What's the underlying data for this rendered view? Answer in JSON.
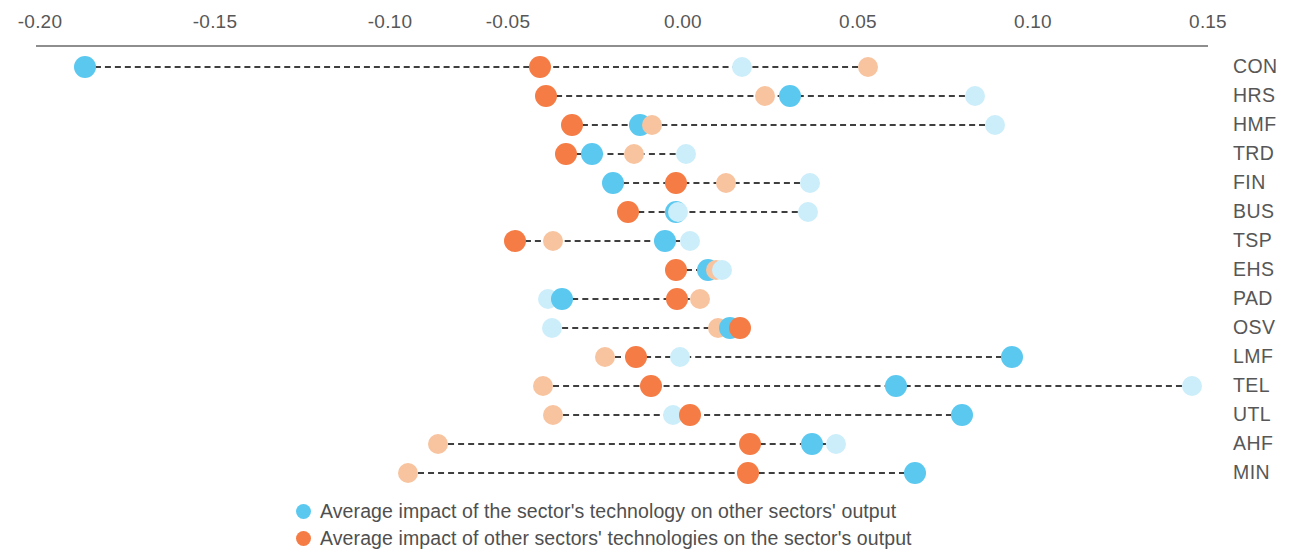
{
  "chart_data": {
    "type": "scatter",
    "title": "",
    "subtitle": "",
    "xlabel": "",
    "ylabel": "",
    "xlim": [
      -0.215,
      0.16
    ],
    "xticks": [
      -0.2,
      -0.15,
      -0.1,
      -0.05,
      0.0,
      0.05,
      0.1,
      0.15
    ],
    "xtick_labels": [
      "-0.20",
      "-0.15",
      "-0.10",
      "-0.05",
      "0.00",
      "0.05",
      "0.10",
      "0.15"
    ],
    "grid": false,
    "legend_position": "bottom-left",
    "categories": [
      "CON",
      "HRS",
      "HMF",
      "TRD",
      "FIN",
      "BUS",
      "TSP",
      "EHS",
      "PAD",
      "OSV",
      "LMF",
      "TEL",
      "UTL",
      "AHF",
      "MIN"
    ],
    "series": [
      {
        "name": "Average impact of the sector's technology on other sectors' output",
        "color": "#5BC8F0",
        "marker": "circle-filled",
        "values": [
          -0.171,
          0.031,
          -0.012,
          -0.026,
          -0.02,
          -0.002,
          -0.005,
          0.007,
          -0.035,
          0.013,
          0.094,
          0.061,
          0.08,
          0.037,
          0.066
        ]
      },
      {
        "name": "Average impact of other sectors' technologies on the sector's output",
        "color": "#F57C45",
        "marker": "circle-filled",
        "values": [
          -0.041,
          -0.039,
          -0.032,
          -0.033,
          -0.002,
          -0.016,
          -0.048,
          -0.002,
          -0.002,
          0.016,
          -0.014,
          -0.009,
          0.002,
          0.019,
          0.019
        ]
      },
      {
        "name": "Light blue marker",
        "color": "#CBEEFA",
        "marker": "circle-light",
        "values": [
          0.017,
          0.083,
          0.089,
          0.001,
          0.036,
          0.036,
          0.002,
          0.011,
          -0.039,
          -0.037,
          -0.001,
          0.145,
          -0.003,
          0.043,
          null
        ]
      },
      {
        "name": "Light orange marker",
        "color": "#F8C4A0",
        "marker": "circle-light",
        "values": [
          0.053,
          0.023,
          -0.009,
          -0.014,
          0.012,
          null,
          -0.037,
          0.009,
          0.005,
          0.01,
          -0.022,
          -0.04,
          -0.037,
          -0.07,
          -0.079
        ]
      }
    ],
    "legend": [
      {
        "label": "Average impact of the sector's technology on other sectors' output",
        "color": "#5BC8F0"
      },
      {
        "label": "Average impact of other sectors' technologies on the sector's output",
        "color": "#F57C45"
      }
    ]
  },
  "axis": {
    "ticks": [
      {
        "label": "-0.20",
        "x": 40
      },
      {
        "label": "-0.15",
        "x": 215
      },
      {
        "label": "-0.10",
        "x": 390
      },
      {
        "label": "-0.05",
        "x": 508
      },
      {
        "label": "0.00",
        "x": 683
      },
      {
        "label": "0.05",
        "x": 858
      },
      {
        "label": "0.10",
        "x": 1033
      },
      {
        "label": "0.15",
        "x": 1208
      }
    ]
  },
  "rows": [
    {
      "label": "CON",
      "y": 52,
      "dots": [
        {
          "x": 85,
          "kind": "blue"
        },
        {
          "x": 540,
          "kind": "orange"
        },
        {
          "x": 742,
          "kind": "blue-light"
        },
        {
          "x": 868,
          "kind": "orange-light"
        }
      ],
      "line": {
        "x1": 85,
        "x2": 868
      }
    },
    {
      "label": "HRS",
      "y": 81,
      "dots": [
        {
          "x": 546,
          "kind": "orange"
        },
        {
          "x": 765,
          "kind": "orange-light"
        },
        {
          "x": 790,
          "kind": "blue"
        },
        {
          "x": 975,
          "kind": "blue-light"
        }
      ],
      "line": {
        "x1": 546,
        "x2": 975
      }
    },
    {
      "label": "HMF",
      "y": 110,
      "dots": [
        {
          "x": 572,
          "kind": "orange"
        },
        {
          "x": 640,
          "kind": "blue"
        },
        {
          "x": 652,
          "kind": "orange-light"
        },
        {
          "x": 995,
          "kind": "blue-light"
        }
      ],
      "line": {
        "x1": 572,
        "x2": 995
      }
    },
    {
      "label": "TRD",
      "y": 139,
      "dots": [
        {
          "x": 566,
          "kind": "orange"
        },
        {
          "x": 592,
          "kind": "blue"
        },
        {
          "x": 634,
          "kind": "orange-light"
        },
        {
          "x": 686,
          "kind": "blue-light"
        }
      ],
      "line": {
        "x1": 566,
        "x2": 686
      }
    },
    {
      "label": "FIN",
      "y": 168,
      "dots": [
        {
          "x": 613,
          "kind": "blue"
        },
        {
          "x": 676,
          "kind": "orange"
        },
        {
          "x": 726,
          "kind": "orange-light"
        },
        {
          "x": 810,
          "kind": "blue-light"
        }
      ],
      "line": {
        "x1": 613,
        "x2": 810
      }
    },
    {
      "label": "BUS",
      "y": 197,
      "dots": [
        {
          "x": 628,
          "kind": "orange"
        },
        {
          "x": 676,
          "kind": "blue"
        },
        {
          "x": 678,
          "kind": "blue-light"
        },
        {
          "x": 808,
          "kind": "blue-light"
        }
      ],
      "line": {
        "x1": 628,
        "x2": 808
      }
    },
    {
      "label": "TSP",
      "y": 226,
      "dots": [
        {
          "x": 515,
          "kind": "orange"
        },
        {
          "x": 553,
          "kind": "orange-light"
        },
        {
          "x": 665,
          "kind": "blue"
        },
        {
          "x": 690,
          "kind": "blue-light"
        }
      ],
      "line": {
        "x1": 515,
        "x2": 690
      }
    },
    {
      "label": "EHS",
      "y": 255,
      "dots": [
        {
          "x": 676,
          "kind": "orange"
        },
        {
          "x": 708,
          "kind": "blue"
        },
        {
          "x": 716,
          "kind": "orange-light"
        },
        {
          "x": 722,
          "kind": "blue-light"
        }
      ],
      "line": {
        "x1": 676,
        "x2": 722
      }
    },
    {
      "label": "PAD",
      "y": 284,
      "dots": [
        {
          "x": 548,
          "kind": "blue-light"
        },
        {
          "x": 562,
          "kind": "blue"
        },
        {
          "x": 677,
          "kind": "orange"
        },
        {
          "x": 700,
          "kind": "orange-light"
        }
      ],
      "line": {
        "x1": 562,
        "x2": 700
      }
    },
    {
      "label": "OSV",
      "y": 313,
      "dots": [
        {
          "x": 552,
          "kind": "blue-light"
        },
        {
          "x": 718,
          "kind": "orange-light"
        },
        {
          "x": 730,
          "kind": "blue"
        },
        {
          "x": 740,
          "kind": "orange"
        }
      ],
      "line": {
        "x1": 552,
        "x2": 740
      }
    },
    {
      "label": "LMF",
      "y": 342,
      "dots": [
        {
          "x": 605,
          "kind": "orange-light"
        },
        {
          "x": 636,
          "kind": "orange"
        },
        {
          "x": 680,
          "kind": "blue-light"
        },
        {
          "x": 1012,
          "kind": "blue"
        }
      ],
      "line": {
        "x1": 605,
        "x2": 1012
      }
    },
    {
      "label": "TEL",
      "y": 371,
      "dots": [
        {
          "x": 543,
          "kind": "orange-light"
        },
        {
          "x": 651,
          "kind": "orange"
        },
        {
          "x": 896,
          "kind": "blue"
        },
        {
          "x": 1192,
          "kind": "blue-light"
        }
      ],
      "line": {
        "x1": 543,
        "x2": 1192
      }
    },
    {
      "label": "UTL",
      "y": 400,
      "dots": [
        {
          "x": 553,
          "kind": "orange-light"
        },
        {
          "x": 673,
          "kind": "blue-light"
        },
        {
          "x": 690,
          "kind": "orange"
        },
        {
          "x": 962,
          "kind": "blue"
        }
      ],
      "line": {
        "x1": 553,
        "x2": 962
      }
    },
    {
      "label": "AHF",
      "y": 429,
      "dots": [
        {
          "x": 438,
          "kind": "orange-light"
        },
        {
          "x": 750,
          "kind": "orange"
        },
        {
          "x": 812,
          "kind": "blue"
        },
        {
          "x": 836,
          "kind": "blue-light"
        }
      ],
      "line": {
        "x1": 438,
        "x2": 836
      }
    },
    {
      "label": "MIN",
      "y": 458,
      "dots": [
        {
          "x": 408,
          "kind": "orange-light"
        },
        {
          "x": 748,
          "kind": "orange"
        },
        {
          "x": 915,
          "kind": "blue"
        }
      ],
      "line": {
        "x1": 408,
        "x2": 915
      }
    }
  ],
  "colors": {
    "blue": "#5BC8F0",
    "orange": "#F57C45",
    "blue-light": "#CBEEFA",
    "orange-light": "#F8C4A0",
    "axis": "#8e8e8e",
    "connector": "#3f3f3f",
    "text": "#575757"
  },
  "legend": {
    "items": [
      {
        "label": "Average impact of the sector's technology on other sectors' output",
        "color": "#5BC8F0"
      },
      {
        "label": "Average impact of other sectors' technologies on the sector's output",
        "color": "#F57C45"
      }
    ]
  }
}
